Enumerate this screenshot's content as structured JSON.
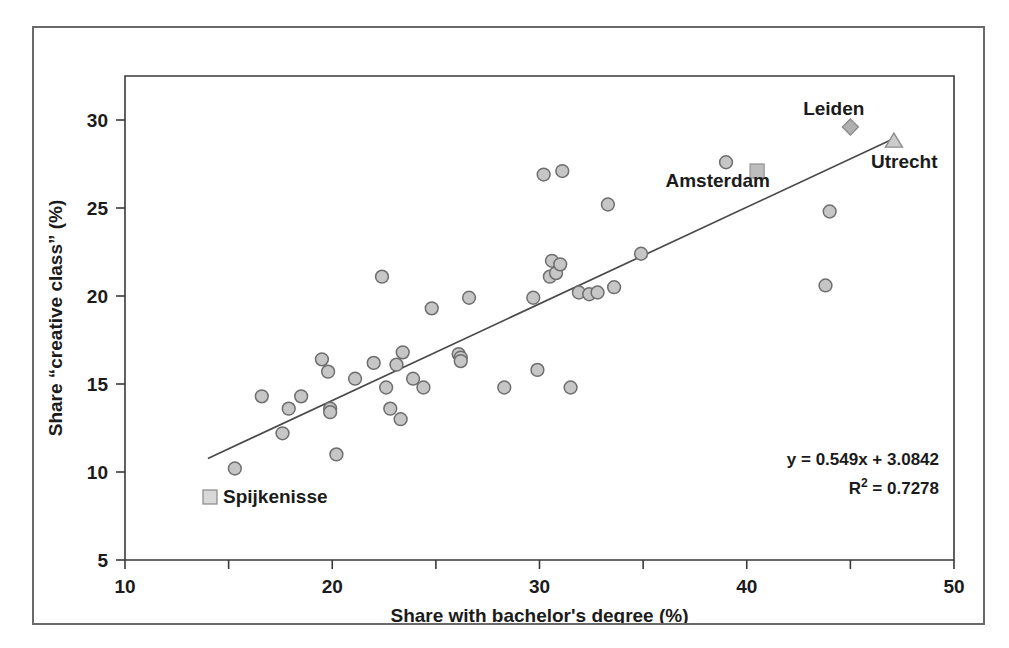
{
  "chart_data": {
    "type": "scatter",
    "title": "",
    "xlabel": "Share with bachelor's degree (%)",
    "ylabel": "Share “creative class” (%)",
    "xlim": [
      10,
      50
    ],
    "ylim": [
      5,
      32.5
    ],
    "xticks": [
      10,
      20,
      30,
      40,
      50
    ],
    "xtick_labels": [
      "10",
      "20",
      "30",
      "40",
      "50"
    ],
    "xminorticks": [
      15,
      25,
      35,
      45
    ],
    "yticks": [
      5,
      10,
      15,
      20,
      25,
      30
    ],
    "ytick_labels": [
      "5",
      "10",
      "15",
      "20",
      "25",
      "30"
    ],
    "grid": false,
    "legend": {
      "position": "inside-bottom-left",
      "entries": [
        {
          "label": "Spijkenisse",
          "marker": "square",
          "color": "#b8b8b8"
        }
      ]
    },
    "annotations": [
      {
        "text": "Leiden",
        "x": 44.2,
        "y": 30.3,
        "anchor": "middle"
      },
      {
        "text": "Utrecht",
        "x": 47.6,
        "y": 27.3,
        "anchor": "middle"
      },
      {
        "text": "Amsterdam",
        "x": 38.6,
        "y": 26.2,
        "anchor": "middle"
      }
    ],
    "trendline": {
      "equation": "y = 0.549x + 3.0842",
      "r2_label": "R",
      "r2_sup": "2",
      "r2_value": " = 0.7278",
      "slope": 0.549,
      "intercept": 3.0842,
      "r2": 0.7278,
      "x_start": 14.0,
      "x_end": 47.0,
      "color": "#4a4a4a"
    },
    "series": [
      {
        "name": "Dutch cities",
        "marker": "circle",
        "fill": "#c6c6c6",
        "stroke": "#6e6e6e",
        "points": [
          {
            "x": 15.3,
            "y": 10.2
          },
          {
            "x": 16.6,
            "y": 14.3
          },
          {
            "x": 17.6,
            "y": 12.2
          },
          {
            "x": 17.9,
            "y": 13.6
          },
          {
            "x": 18.5,
            "y": 14.3
          },
          {
            "x": 19.5,
            "y": 16.4
          },
          {
            "x": 19.8,
            "y": 15.7
          },
          {
            "x": 19.9,
            "y": 13.6
          },
          {
            "x": 19.9,
            "y": 13.4
          },
          {
            "x": 20.2,
            "y": 11.0
          },
          {
            "x": 21.1,
            "y": 15.3
          },
          {
            "x": 22.0,
            "y": 16.2
          },
          {
            "x": 22.4,
            "y": 21.1
          },
          {
            "x": 22.6,
            "y": 14.8
          },
          {
            "x": 22.8,
            "y": 13.6
          },
          {
            "x": 23.1,
            "y": 16.1
          },
          {
            "x": 23.4,
            "y": 16.8
          },
          {
            "x": 23.3,
            "y": 13.0
          },
          {
            "x": 23.9,
            "y": 15.3
          },
          {
            "x": 24.4,
            "y": 14.8
          },
          {
            "x": 24.8,
            "y": 19.3
          },
          {
            "x": 26.1,
            "y": 16.7
          },
          {
            "x": 26.2,
            "y": 16.5
          },
          {
            "x": 26.2,
            "y": 16.3
          },
          {
            "x": 26.6,
            "y": 19.9
          },
          {
            "x": 28.3,
            "y": 14.8
          },
          {
            "x": 29.7,
            "y": 19.9
          },
          {
            "x": 29.9,
            "y": 15.8
          },
          {
            "x": 30.2,
            "y": 26.9
          },
          {
            "x": 30.5,
            "y": 21.1
          },
          {
            "x": 30.6,
            "y": 22.0
          },
          {
            "x": 30.8,
            "y": 21.3
          },
          {
            "x": 31.0,
            "y": 21.8
          },
          {
            "x": 31.1,
            "y": 27.1
          },
          {
            "x": 31.5,
            "y": 14.8
          },
          {
            "x": 31.9,
            "y": 20.2
          },
          {
            "x": 32.4,
            "y": 20.1
          },
          {
            "x": 32.8,
            "y": 20.2
          },
          {
            "x": 33.3,
            "y": 25.2
          },
          {
            "x": 33.6,
            "y": 20.5
          },
          {
            "x": 34.9,
            "y": 22.4
          },
          {
            "x": 39.0,
            "y": 27.6
          },
          {
            "x": 43.8,
            "y": 20.6
          },
          {
            "x": 44.0,
            "y": 24.8
          }
        ]
      },
      {
        "name": "Leiden",
        "marker": "diamond",
        "fill": "#b0b0b0",
        "stroke": "#8c8c8c",
        "points": [
          {
            "x": 45.0,
            "y": 29.6
          }
        ]
      },
      {
        "name": "Utrecht",
        "marker": "triangle",
        "fill": "#cccccc",
        "stroke": "#8c8c8c",
        "points": [
          {
            "x": 47.1,
            "y": 28.8
          }
        ]
      },
      {
        "name": "Amsterdam",
        "marker": "square",
        "fill": "#bdbdbd",
        "stroke": "#9a9a9a",
        "points": [
          {
            "x": 40.5,
            "y": 27.1
          }
        ]
      }
    ]
  },
  "colors": {
    "frame": "#6a6a6a",
    "axis": "#3a3a3a",
    "text": "#1b1b1b",
    "marker_fill": "#c6c6c6",
    "marker_stroke": "#6e6e6e",
    "trendline": "#4a4a4a"
  }
}
